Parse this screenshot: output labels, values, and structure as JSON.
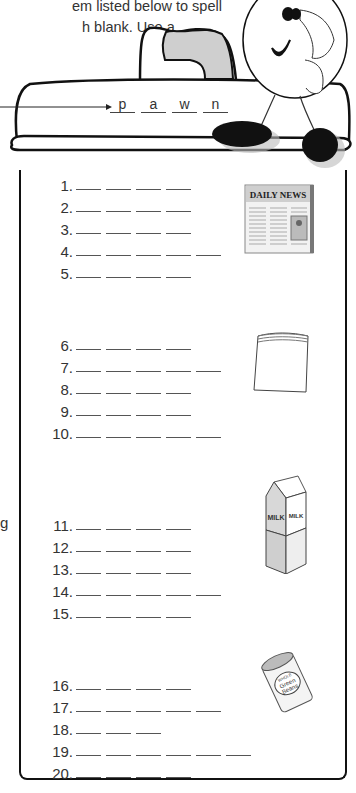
{
  "instructions": {
    "line1": "em listed below to spell",
    "line2": "h blank. Use a",
    "side_fragment": "g"
  },
  "example": {
    "letters": [
      "p",
      "a",
      "w",
      "n"
    ]
  },
  "groups": [
    {
      "image": "newspaper-icon",
      "image_label": "DAILY NEWS",
      "items": [
        {
          "number": "1.",
          "blanks": 4
        },
        {
          "number": "2.",
          "blanks": 4
        },
        {
          "number": "3.",
          "blanks": 4
        },
        {
          "number": "4.",
          "blanks": 5
        },
        {
          "number": "5.",
          "blanks": 4
        }
      ]
    },
    {
      "image": "plastic-bag-icon",
      "image_label": "",
      "items": [
        {
          "number": "6.",
          "blanks": 4
        },
        {
          "number": "7.",
          "blanks": 5
        },
        {
          "number": "8.",
          "blanks": 4
        },
        {
          "number": "9.",
          "blanks": 4
        },
        {
          "number": "10.",
          "blanks": 5
        }
      ]
    },
    {
      "image": "milk-carton-icon",
      "image_label": "MILK",
      "image_sublabel": "VITAMIN D",
      "items": [
        {
          "number": "11.",
          "blanks": 4
        },
        {
          "number": "12.",
          "blanks": 4
        },
        {
          "number": "13.",
          "blanks": 4
        },
        {
          "number": "14.",
          "blanks": 5
        },
        {
          "number": "15.",
          "blanks": 4
        }
      ]
    },
    {
      "image": "green-beans-can-icon",
      "image_label": "Green Beans",
      "image_sublabel": "WHOLE",
      "items": [
        {
          "number": "16.",
          "blanks": 4
        },
        {
          "number": "17.",
          "blanks": 5
        },
        {
          "number": "18.",
          "blanks": 3
        },
        {
          "number": "19.",
          "blanks": 6
        },
        {
          "number": "20.",
          "blanks": 4
        }
      ]
    }
  ]
}
